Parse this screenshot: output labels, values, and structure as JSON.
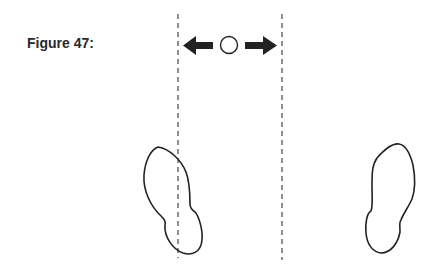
{
  "figure": {
    "caption": "Figure 47:",
    "elements": {
      "guide_lines": [
        "left-dashed-line",
        "right-dashed-line"
      ],
      "direction_indicator": "bidirectional-arrows-with-circle",
      "footprints": [
        "left-footprint",
        "right-footprint"
      ]
    },
    "colors": {
      "ink": "#222222",
      "dash": "#555555",
      "background": "#ffffff"
    }
  }
}
